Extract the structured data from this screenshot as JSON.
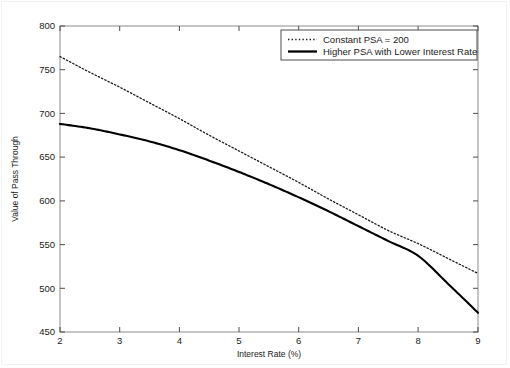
{
  "chart_data": {
    "type": "line",
    "title": "",
    "xlabel": "Interest Rate (%)",
    "ylabel": "Value of Pass Through",
    "xlim": [
      2,
      9
    ],
    "ylim": [
      450,
      800
    ],
    "xticks": [
      2,
      3,
      4,
      5,
      6,
      7,
      8,
      9
    ],
    "xtick_labels": [
      "2",
      "3",
      "4",
      "5",
      "6",
      "7",
      "8",
      "9"
    ],
    "yticks": [
      450,
      500,
      550,
      600,
      650,
      700,
      750,
      800
    ],
    "ytick_labels": [
      "450",
      "500",
      "550",
      "600",
      "650",
      "700",
      "750",
      "800"
    ],
    "grid": false,
    "legend_position": "top-right",
    "x": [
      2.0,
      2.5,
      3.0,
      3.5,
      4.0,
      4.5,
      5.0,
      5.5,
      6.0,
      6.5,
      7.0,
      7.5,
      8.0,
      8.5,
      9.0
    ],
    "series": [
      {
        "name": "Constant PSA = 200",
        "style": "dotted",
        "color": "#1a1a1a",
        "values": [
          765,
          747,
          730,
          712,
          694,
          675,
          657,
          639,
          621,
          602,
          584,
          566,
          551,
          534,
          517
        ]
      },
      {
        "name": "Higher PSA with Lower Interest Rate",
        "style": "solid",
        "color": "#000000",
        "values": [
          688,
          683,
          676,
          668,
          658,
          646,
          633,
          619,
          604,
          588,
          571,
          554,
          537,
          505,
          472
        ]
      }
    ]
  },
  "legend": {
    "entries": [
      {
        "label": "Constant PSA = 200",
        "marker": "dotted-line-swatch"
      },
      {
        "label": "Higher PSA with Lower Interest Rate",
        "marker": "solid-line-swatch"
      }
    ]
  },
  "axes": {
    "x_title": "Interest Rate (%)",
    "y_title": "Value of Pass Through"
  },
  "colors": {
    "line": "#000000",
    "axis": "#808080",
    "text": "#1a1a1a",
    "background": "#ffffff"
  }
}
